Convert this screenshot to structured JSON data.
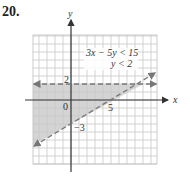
{
  "problem": {
    "number": "20."
  },
  "axes": {
    "x_label": "x",
    "y_label": "y",
    "origin_label": "0"
  },
  "labels": {
    "y_intercept_hline": "2",
    "x_intercept": "5",
    "y_intercept_line": "−3"
  },
  "legend": {
    "ineq1": "3x − 5y < 15",
    "ineq2": "y < 2"
  },
  "colors": {
    "grid": "#c8c8c8",
    "shade": "#d4d4d4",
    "dash": "#777777",
    "axis": "#333333"
  },
  "graph": {
    "unit_px": 8,
    "origin_px": [
      71,
      100
    ],
    "grid_bounds_px": {
      "left": 33,
      "right": 157,
      "top": 35,
      "bottom": 164
    },
    "lines": [
      {
        "equation": "3x - 5y = 15",
        "style": "dashed",
        "x_intercept": 5,
        "y_intercept": -3
      },
      {
        "equation": "y = 2",
        "style": "dashed"
      }
    ],
    "shaded_region": "3x - 5y < 15 and y < 2"
  }
}
